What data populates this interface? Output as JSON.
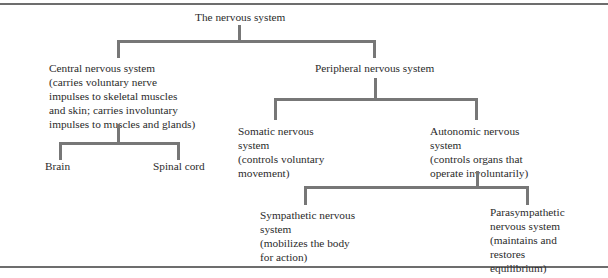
{
  "diagram": {
    "root": {
      "title": "The nervous system"
    },
    "cns": {
      "title": "Central nervous system",
      "desc_lines": [
        "(carries voluntary nerve",
        "impulses to skeletal muscles",
        "and skin; carries involuntary",
        "impulses to muscles and glands)"
      ]
    },
    "brain": {
      "title": "Brain"
    },
    "spinal_cord": {
      "title": "Spinal cord"
    },
    "pns": {
      "title": "Peripheral nervous system"
    },
    "somatic": {
      "title_lines": [
        "Somatic nervous",
        "system"
      ],
      "desc_lines": [
        "(controls voluntary",
        "movement)"
      ]
    },
    "autonomic": {
      "title_lines": [
        "Autonomic nervous",
        "system"
      ],
      "desc_lines": [
        "(controls organs that",
        "operate involuntarily)"
      ]
    },
    "sympathetic": {
      "title_lines": [
        "Sympathetic nervous",
        "system"
      ],
      "desc_lines": [
        "(mobilizes the body",
        "for action)"
      ]
    },
    "parasympathetic": {
      "title_lines": [
        "Parasympathetic",
        "nervous system"
      ],
      "desc_lines": [
        "(maintains and",
        "restores",
        "equilibrium)"
      ]
    },
    "colors": {
      "connector": "#777777",
      "rule": "#6d6d6d",
      "text": "#2b2b2b"
    }
  }
}
